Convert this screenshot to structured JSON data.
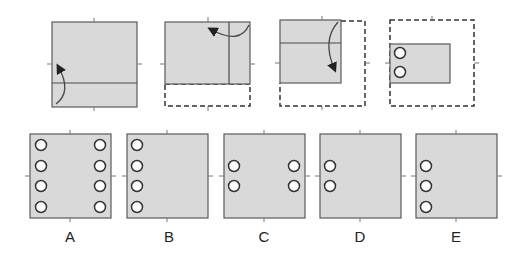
{
  "colors": {
    "paper_fill": "#d9d9d9",
    "stroke": "#5a5a5a",
    "dashed": "#333333",
    "hole_fill": "#ffffff",
    "hole_stroke": "#333333"
  },
  "fold_sequence": [
    {
      "step": 1,
      "description": "Square paper; bottom strip folded up along horizontal line",
      "arrow": "up"
    },
    {
      "step": 2,
      "description": "Folded paper with dashed outline below; right strip folded to the left along vertical line",
      "arrow": "left"
    },
    {
      "step": 3,
      "description": "Further folded paper with dashed outline right and bottom; top folded down",
      "arrow": "down"
    },
    {
      "step": 4,
      "description": "Final folded rectangle with two punched holes at left",
      "holes": 2
    }
  ],
  "options": [
    {
      "label": "A",
      "holes": "4 left, 4 right"
    },
    {
      "label": "B",
      "holes": "4 left"
    },
    {
      "label": "C",
      "holes": "2 left middle, 2 right middle"
    },
    {
      "label": "D",
      "holes": "2 left middle"
    },
    {
      "label": "E",
      "holes": "3 left lower"
    }
  ]
}
